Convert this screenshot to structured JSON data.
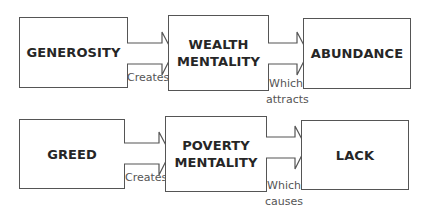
{
  "rows": [
    {
      "boxes": [
        {
          "label": "GENEROSITY"
        },
        {
          "label": "WEALTH\nMENTALITY"
        },
        {
          "label": "ABUNDANCE"
        }
      ],
      "arrows": [
        {
          "caption": "Creates"
        },
        {
          "caption": "Which\nattracts"
        }
      ]
    },
    {
      "boxes": [
        {
          "label": "GREED"
        },
        {
          "label": "POVERTY\nMENTALITY"
        },
        {
          "label": "LACK"
        }
      ],
      "arrows": [
        {
          "caption": "Creates"
        },
        {
          "caption": "Which\ncauses"
        }
      ]
    }
  ],
  "colors": {
    "line": "#555555",
    "text": "#262626",
    "caption": "#555555"
  }
}
